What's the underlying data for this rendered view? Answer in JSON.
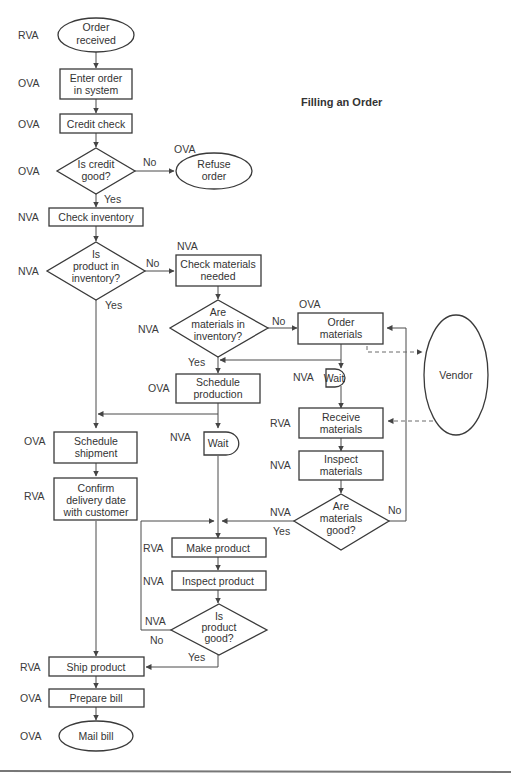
{
  "title": "Filling an Order",
  "nodes": {
    "order_received": {
      "type": "terminal",
      "lines": [
        "Order",
        "received"
      ],
      "va": "RVA"
    },
    "enter_order": {
      "type": "process",
      "lines": [
        "Enter order",
        "in system"
      ],
      "va": "OVA"
    },
    "credit_check": {
      "type": "process",
      "lines": [
        "Credit check"
      ],
      "va": "OVA"
    },
    "is_credit_good": {
      "type": "decision",
      "lines": [
        "Is credit",
        "good?"
      ],
      "va": "OVA"
    },
    "refuse_order": {
      "type": "terminal",
      "lines": [
        "Refuse",
        "order"
      ],
      "va": "OVA"
    },
    "check_inventory": {
      "type": "process",
      "lines": [
        "Check inventory"
      ],
      "va": "NVA"
    },
    "is_product_in_inventory": {
      "type": "decision",
      "lines": [
        "Is",
        "product in",
        "inventory?"
      ],
      "va": "NVA"
    },
    "check_materials": {
      "type": "process",
      "lines": [
        "Check materials",
        "needed"
      ],
      "va": "NVA"
    },
    "are_materials_in_inventory": {
      "type": "decision",
      "lines": [
        "Are",
        "materials in",
        "inventory?"
      ],
      "va": "NVA"
    },
    "order_materials": {
      "type": "process",
      "lines": [
        "Order",
        "materials"
      ],
      "va": "OVA"
    },
    "vendor": {
      "type": "external",
      "lines": [
        "Vendor"
      ]
    },
    "schedule_production": {
      "type": "process",
      "lines": [
        "Schedule",
        "production"
      ],
      "va": "OVA"
    },
    "wait_1": {
      "type": "delay",
      "lines": [
        "Wait"
      ],
      "va": "NVA"
    },
    "receive_materials": {
      "type": "process",
      "lines": [
        "Receive",
        "materials"
      ],
      "va": "RVA"
    },
    "inspect_materials": {
      "type": "process",
      "lines": [
        "Inspect",
        "materials"
      ],
      "va": "NVA"
    },
    "are_materials_good": {
      "type": "decision",
      "lines": [
        "Are",
        "materials",
        "good?"
      ],
      "va": "NVA"
    },
    "schedule_shipment": {
      "type": "process",
      "lines": [
        "Schedule",
        "shipment"
      ],
      "va": "OVA"
    },
    "wait_2": {
      "type": "delay",
      "lines": [
        "Wait"
      ],
      "va": "NVA"
    },
    "confirm_delivery": {
      "type": "process",
      "lines": [
        "Confirm",
        "delivery date",
        "with customer"
      ],
      "va": "RVA"
    },
    "make_product": {
      "type": "process",
      "lines": [
        "Make product"
      ],
      "va": "RVA"
    },
    "inspect_product": {
      "type": "process",
      "lines": [
        "Inspect product"
      ],
      "va": "NVA"
    },
    "is_product_good": {
      "type": "decision",
      "lines": [
        "Is",
        "product",
        "good?"
      ],
      "va": "NVA"
    },
    "ship_product": {
      "type": "process",
      "lines": [
        "Ship product"
      ],
      "va": "RVA"
    },
    "prepare_bill": {
      "type": "process",
      "lines": [
        "Prepare bill"
      ],
      "va": "OVA"
    },
    "mail_bill": {
      "type": "terminal",
      "lines": [
        "Mail bill"
      ],
      "va": "OVA"
    }
  },
  "edge_labels": {
    "credit_no": "No",
    "credit_yes": "Yes",
    "inv_no": "No",
    "inv_yes": "Yes",
    "mat_inv_no": "No",
    "mat_inv_yes": "Yes",
    "mat_good_no": "No",
    "mat_good_yes": "Yes",
    "prod_good_no": "No",
    "prod_good_yes": "Yes"
  },
  "legend": {
    "RVA": "Real value added",
    "OVA": "Organizational value added",
    "NVA": "No value added"
  }
}
